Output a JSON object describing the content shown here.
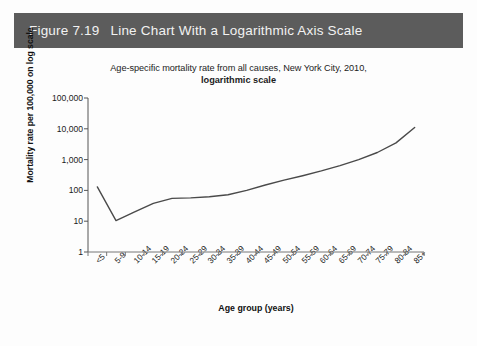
{
  "figure": {
    "number": "Figure 7.19",
    "caption": "Line Chart With a Logarithmic Axis Scale",
    "header_bg": "#5c5c5c",
    "header_text_color": "#f2f2f2"
  },
  "chart_data": {
    "type": "line",
    "title": "Age-specific mortality rate from all causes, New York City, 2010,",
    "subtitle": "logarithmic scale",
    "xlabel": "Age group (years)",
    "ylabel": "Mortality rate per 100,000 on log scale",
    "yscale": "log",
    "ylim": [
      1,
      100000
    ],
    "ytick_values": [
      1,
      10,
      100,
      1000,
      10000,
      100000
    ],
    "ytick_labels": [
      "1",
      "10",
      "100",
      "1,000",
      "10,000",
      "100,000"
    ],
    "grid": false,
    "legend": "none",
    "line_color": "#4a4a4a",
    "categories": [
      "<5",
      "5-9",
      "10-14",
      "15-19",
      "20-24",
      "25-29",
      "30-34",
      "35-39",
      "40-44",
      "45-49",
      "50-54",
      "55-59",
      "60-64",
      "65-69",
      "70-74",
      "75-79",
      "80-84",
      "85+"
    ],
    "values": [
      130,
      10.5,
      20,
      38,
      55,
      57,
      62,
      72,
      100,
      150,
      215,
      300,
      430,
      640,
      1000,
      1700,
      3500,
      11000
    ],
    "series": [
      {
        "name": "Age-specific mortality rate",
        "values": [
          130,
          10.5,
          20,
          38,
          55,
          57,
          62,
          72,
          100,
          150,
          215,
          300,
          430,
          640,
          1000,
          1700,
          3500,
          11000
        ]
      }
    ]
  }
}
